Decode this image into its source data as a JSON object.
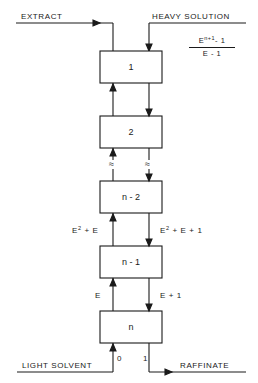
{
  "diagram": {
    "inputs": {
      "top_right": "HEAVY SOLUTION",
      "bottom_left": "LIGHT SOLVENT"
    },
    "outputs": {
      "top_left": "EXTRACT",
      "bottom_right": "RAFFINATE"
    },
    "feed_expression": {
      "numerator_base": "E",
      "numerator_exp": "n+1",
      "numerator_tail": "- 1",
      "denominator": "E - 1"
    },
    "stages": [
      {
        "label": "1"
      },
      {
        "label": "2"
      },
      {
        "label": "n - 2"
      },
      {
        "label": "n - 1"
      },
      {
        "label": "n"
      }
    ],
    "flows": {
      "between_n2_n1_up": {
        "base": "E",
        "exp": "2",
        "tail": " + E"
      },
      "between_n2_n1_down": {
        "base": "E",
        "exp": "2",
        "tail": " + E + 1"
      },
      "between_n1_n_up": "E",
      "between_n1_n_down": "E + 1",
      "bottom_in_light": "0",
      "bottom_out_heavy": "1"
    },
    "break_symbol": "≈"
  }
}
